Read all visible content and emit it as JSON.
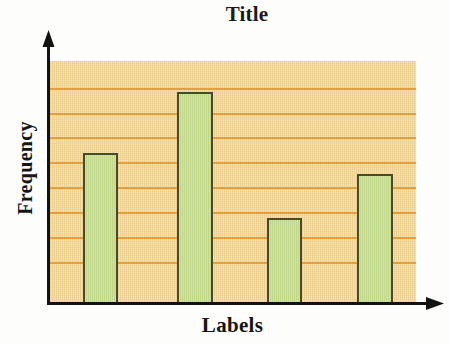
{
  "chart_data": {
    "type": "bar",
    "title": "Title",
    "xlabel": "Labels",
    "ylabel": "Frequency",
    "categories": [
      "",
      "",
      "",
      ""
    ],
    "values": [
      5.1,
      7.6,
      3.0,
      4.6
    ],
    "ylim": [
      0,
      9.2
    ],
    "grid": true,
    "gridlines": 8,
    "legend": "none",
    "tick_labels": {
      "x": [],
      "y": []
    },
    "axis_arrows": true,
    "bar_count": 4,
    "bars": [
      {
        "index": 1,
        "value": 5.1,
        "top_px": 153,
        "left_px": 83,
        "width_px": 35
      },
      {
        "index": 2,
        "value": 7.6,
        "top_px": 92,
        "left_px": 177,
        "width_px": 36
      },
      {
        "index": 3,
        "value": 3.0,
        "top_px": 218,
        "left_px": 267,
        "width_px": 35
      },
      {
        "index": 4,
        "value": 4.6,
        "top_px": 174,
        "left_px": 357,
        "width_px": 36
      }
    ],
    "gridline_positions_px": [
      88,
      113,
      137,
      162,
      187,
      212,
      237,
      262
    ]
  },
  "colors": {
    "plot_background": "#f0d79a",
    "gridline": "#e19a34",
    "bar_fill": "#c6dc92",
    "bar_border": "#4a4a28",
    "axis": "#121212",
    "text": "#151515",
    "page_background": "#fdfdfb"
  },
  "plot_area": {
    "left_px": 49,
    "top_px": 61,
    "width_px": 367,
    "height_px": 242
  }
}
